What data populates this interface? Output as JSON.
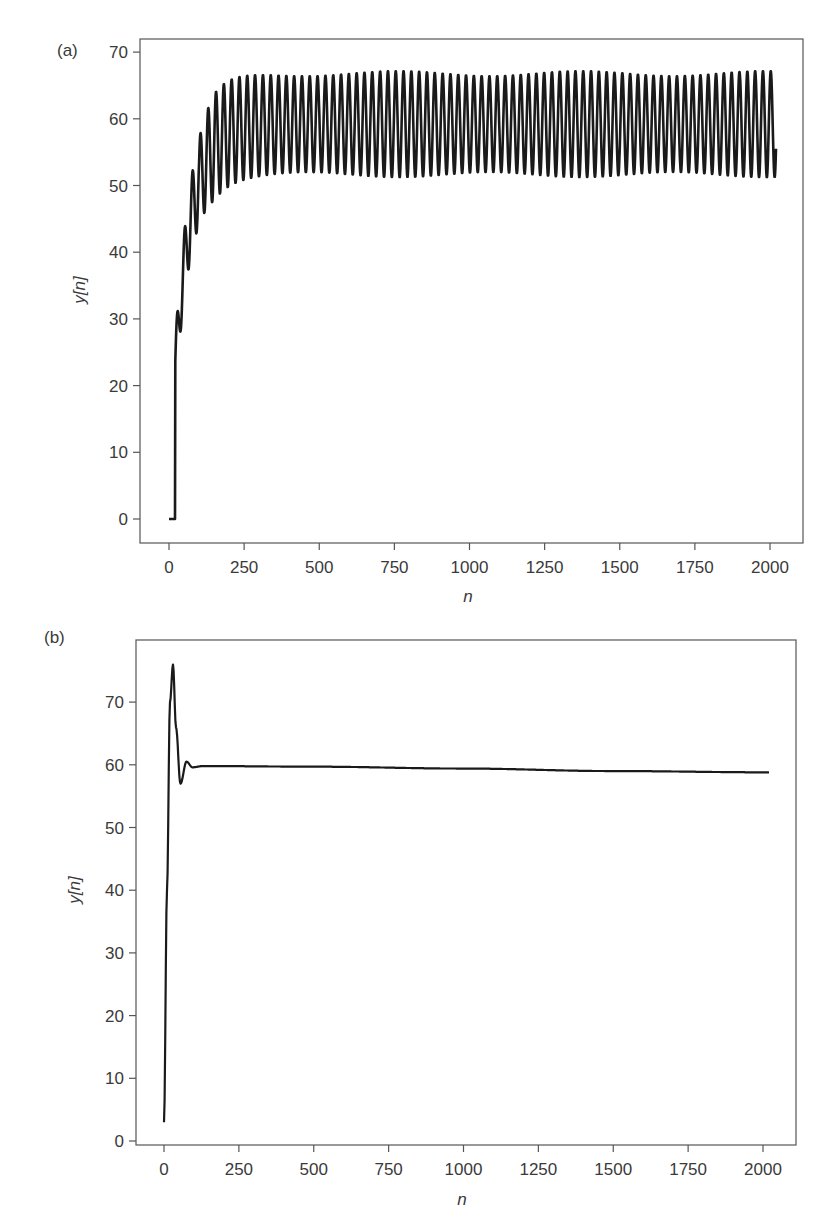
{
  "chart_data": [
    {
      "type": "line",
      "panel_label": "(a)",
      "title": "",
      "xlabel": "n",
      "ylabel": "y[n]",
      "xlim": [
        -100,
        2100
      ],
      "ylim": [
        -4,
        72
      ],
      "xticks": [
        0,
        250,
        500,
        750,
        1000,
        1250,
        1500,
        1750,
        2000
      ],
      "yticks": [
        0,
        10,
        20,
        30,
        40,
        50,
        60,
        70
      ],
      "grid": false,
      "legend": null,
      "description": "Sustained oscillation: zero until n≈20, fast rise with growing oscillation, then steady oscillation between ~51 and ~67 (period ≈26 samples) up to n≈2020",
      "series": [
        {
          "name": "y[n]",
          "color": "#1a1a1a",
          "line_width": 2.6,
          "n_end": 2020,
          "start_delay": 20,
          "period": 26,
          "steady_mean": 59.2,
          "steady_amplitude": 7.6,
          "key_points": [
            {
              "n": 0,
              "y": 0
            },
            {
              "n": 20,
              "y": 0
            },
            {
              "n": 21,
              "y": 23
            },
            {
              "n": 35,
              "y": 34
            },
            {
              "n": 50,
              "y": 26
            },
            {
              "n": 70,
              "y": 51
            },
            {
              "n": 85,
              "y": 38
            },
            {
              "n": 100,
              "y": 60.5
            },
            {
              "n": 115,
              "y": 47
            },
            {
              "n": 150,
              "y": 64
            },
            {
              "n": 175,
              "y": 50
            },
            {
              "n": 280,
              "y": 68
            },
            {
              "n": 300,
              "y": 52
            },
            {
              "n": 1000,
              "y": 67
            },
            {
              "n": 1000,
              "y": 51.5
            },
            {
              "n": 2020,
              "y": 64
            }
          ]
        }
      ]
    },
    {
      "type": "line",
      "panel_label": "(b)",
      "title": "",
      "xlabel": "n",
      "ylabel": "y[n]",
      "xlim": [
        -100,
        2100
      ],
      "ylim": [
        -1,
        79
      ],
      "xticks": [
        0,
        250,
        500,
        750,
        1000,
        1250,
        1500,
        1750,
        2000
      ],
      "yticks": [
        0,
        10,
        20,
        30,
        40,
        50,
        60,
        70
      ],
      "grid": false,
      "legend": null,
      "description": "Damped response: starts at ~3, overshoots to ~76 at n≈30, undershoots to ~57 at n≈55, settles near 59.8 and drifts to ~58.8 by n≈2020",
      "series": [
        {
          "name": "y[n]",
          "color": "#1a1a1a",
          "line_width": 2.2,
          "key_points": [
            {
              "n": 0,
              "y": 3
            },
            {
              "n": 10,
              "y": 40
            },
            {
              "n": 20,
              "y": 70
            },
            {
              "n": 30,
              "y": 76
            },
            {
              "n": 40,
              "y": 66
            },
            {
              "n": 55,
              "y": 57
            },
            {
              "n": 75,
              "y": 60.5
            },
            {
              "n": 95,
              "y": 59.6
            },
            {
              "n": 130,
              "y": 59.8
            },
            {
              "n": 500,
              "y": 59.7
            },
            {
              "n": 1000,
              "y": 59.4
            },
            {
              "n": 1500,
              "y": 59.0
            },
            {
              "n": 2020,
              "y": 58.8
            }
          ]
        }
      ]
    }
  ],
  "panels": {
    "a": {
      "label": "(a)",
      "xlabel": "n",
      "ylabel": "y[n]"
    },
    "b": {
      "label": "(b)",
      "xlabel": "n",
      "ylabel": "y[n]"
    }
  }
}
